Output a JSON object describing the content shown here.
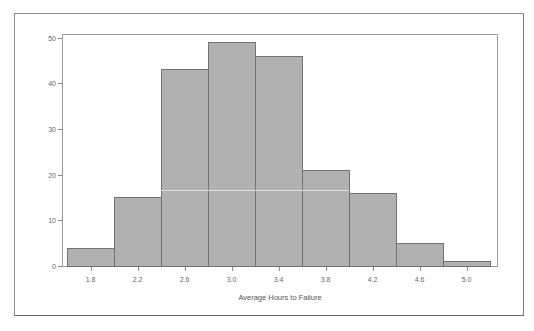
{
  "chart_data": {
    "type": "bar",
    "title": "",
    "xlabel": "Average Hours to Failure",
    "ylabel": "",
    "categories": [
      "1.8",
      "2.0",
      "2.2",
      "2.4",
      "2.6",
      "2.8",
      "3.0",
      "3.2",
      "3.4"
    ],
    "x_tick_labels": [
      "1.8",
      "2.2",
      "2.6",
      "3.0",
      "3.4",
      "3.8",
      "4.2",
      "4.6",
      "5.0"
    ],
    "values": [
      4,
      15,
      43,
      49,
      46,
      21,
      16,
      5,
      1
    ],
    "y_ticks": [
      0,
      10,
      20,
      30,
      40,
      50
    ],
    "ylim": [
      0,
      51
    ],
    "grid": false,
    "legend": "none",
    "colors": {
      "bar_fill": "#b1b1b1",
      "bar_border": "#727272"
    }
  },
  "axis": {
    "x_title": "Average Hours to Failure",
    "y_labels": [
      "0",
      "10",
      "20",
      "30",
      "40",
      "50"
    ],
    "x_labels": [
      "1.8",
      "2.2",
      "2.6",
      "3.0",
      "3.4",
      "3.8",
      "4.2",
      "4.6",
      "5.0"
    ]
  }
}
